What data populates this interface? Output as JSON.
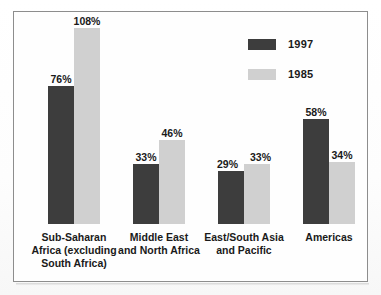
{
  "figure": {
    "frame": {
      "border_color": "#8d8d8d",
      "background": "#fefefe"
    }
  },
  "legend": {
    "position": "top-right",
    "entries": [
      {
        "label": "1997",
        "color": "#3d3d3d",
        "swatch_name": "legend-swatch-1997"
      },
      {
        "label": "1985",
        "color": "#d0d0d0",
        "swatch_name": "legend-swatch-1985"
      }
    ]
  },
  "chart_data": {
    "type": "bar",
    "title": "",
    "subtitle": "",
    "xlabel": "",
    "ylabel": "",
    "ylim": [
      0,
      110
    ],
    "grid": false,
    "legend_position": "top-right",
    "value_suffix": "%",
    "categories": [
      "Sub-Saharan Africa (excluding South Africa)",
      "Middle East and North Africa",
      "East/South Asia and Pacific",
      "Americas"
    ],
    "category_label_lines": [
      [
        "Sub-Saharan",
        "Africa (excluding",
        "South Africa)"
      ],
      [
        "Middle East",
        "and North Africa"
      ],
      [
        "East/South Asia",
        "and Pacific"
      ],
      [
        "Americas"
      ]
    ],
    "series": [
      {
        "name": "1997",
        "color": "#3d3d3d",
        "values": [
          76,
          33,
          29,
          58
        ],
        "value_labels": [
          "76%",
          "33%",
          "29%",
          "58%"
        ]
      },
      {
        "name": "1985",
        "color": "#d0d0d0",
        "values": [
          108,
          46,
          33,
          34
        ],
        "value_labels": [
          "108%",
          "46%",
          "33%",
          "34%"
        ]
      }
    ]
  }
}
